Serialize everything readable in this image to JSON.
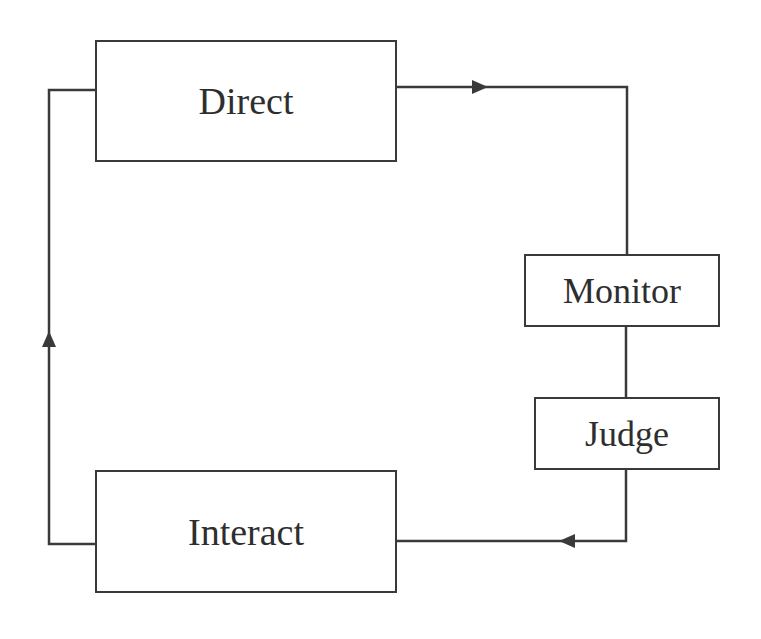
{
  "diagram": {
    "type": "cycle-flow",
    "nodes": [
      {
        "id": "direct",
        "label": "Direct"
      },
      {
        "id": "monitor",
        "label": "Monitor"
      },
      {
        "id": "judge",
        "label": "Judge"
      },
      {
        "id": "interact",
        "label": "Interact"
      }
    ],
    "edges": [
      {
        "from": "direct",
        "to": "monitor",
        "arrow": "right"
      },
      {
        "from": "monitor",
        "to": "judge",
        "arrow": "none"
      },
      {
        "from": "judge",
        "to": "interact",
        "arrow": "left"
      },
      {
        "from": "interact",
        "to": "direct",
        "arrow": "up"
      }
    ],
    "colors": {
      "line": "#3a3a3a",
      "text": "#2e2e2e",
      "background": "#ffffff"
    }
  }
}
